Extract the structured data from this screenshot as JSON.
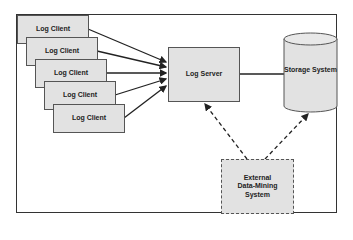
{
  "diagram": {
    "clients": [
      {
        "label": "Log Client"
      },
      {
        "label": "Log Client"
      },
      {
        "label": "Log Client"
      },
      {
        "label": "Log Client"
      },
      {
        "label": "Log Client"
      }
    ],
    "server": {
      "label": "Log Server"
    },
    "storage": {
      "label": "Storage System"
    },
    "external": {
      "line1": "External",
      "line2": "Data-Mining",
      "line3": "System"
    },
    "edges": [
      {
        "from": "Log Client",
        "to": "Log Server",
        "style": "solid-arrow"
      },
      {
        "from": "Log Server",
        "to": "Storage System",
        "style": "solid-line"
      },
      {
        "from": "External Data-Mining System",
        "to": "Log Server",
        "style": "dashed-arrow"
      },
      {
        "from": "External Data-Mining System",
        "to": "Storage System",
        "style": "dashed-arrow"
      }
    ],
    "colors": {
      "box_fill": "#e2e2e2",
      "stroke": "#333333"
    }
  }
}
